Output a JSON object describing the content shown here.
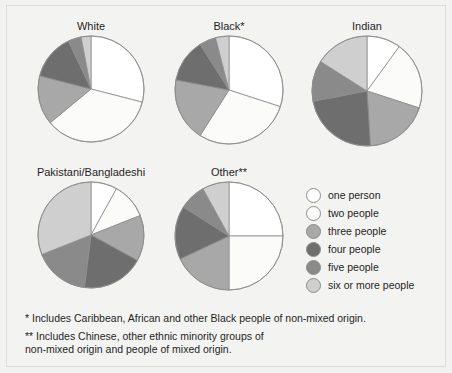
{
  "chart_data": {
    "type": "pie",
    "legend_position": "center-right",
    "legend": [
      {
        "label": "one person",
        "color": "#ffffff"
      },
      {
        "label": "two people",
        "color": "#fbfbfa"
      },
      {
        "label": "three people",
        "color": "#a8a8a8"
      },
      {
        "label": "four people",
        "color": "#6e6e6e"
      },
      {
        "label": "five people",
        "color": "#8a8a8a"
      },
      {
        "label": "six or more people",
        "color": "#cfcfcf"
      }
    ],
    "categories": [
      "one person",
      "two people",
      "three people",
      "four people",
      "five people",
      "six or more people"
    ],
    "charts": [
      {
        "title": "White",
        "values": [
          29,
          35,
          15,
          14,
          4,
          3
        ]
      },
      {
        "title": "Black*",
        "values": [
          30,
          29,
          19,
          13,
          5,
          4
        ]
      },
      {
        "title": "Indian",
        "values": [
          10,
          20,
          19,
          23,
          12,
          16
        ]
      },
      {
        "title": "Pakistani/Bangladeshi",
        "values": [
          8,
          11,
          14,
          19,
          17,
          31
        ]
      },
      {
        "title": "Other**",
        "values": [
          25,
          25,
          18,
          16,
          8,
          8
        ]
      }
    ],
    "footnotes": [
      "*  Includes Caribbean, African and other Black people of non-mixed origin.",
      "** Includes Chinese, other ethnic minority groups of\n     non-mixed origin and people of mixed origin."
    ]
  },
  "figure": {
    "background": "#f3f3f1",
    "border_color": "#dcdcd8",
    "slice_stroke": "#8d8d8d"
  }
}
